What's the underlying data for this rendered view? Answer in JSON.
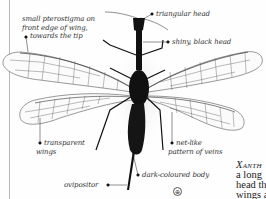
{
  "illustration": {
    "subject": "xanthostigma-snakefly",
    "labels": {
      "pterostigma": [
        "small pterostigma on",
        "front edge of wing,",
        "towards the tip"
      ],
      "head_shape": "triangular head",
      "head_color": "shiny, black head",
      "wings": [
        "transparent",
        "wings"
      ],
      "veins": [
        "net-like",
        "pattern of veins"
      ],
      "ovipositor": "ovipositor",
      "body": "dark-coloured body"
    },
    "locator_icon": "⊕"
  },
  "caption": {
    "title": "Xanth",
    "lines": [
      "a long",
      "head th",
      "wings a"
    ]
  },
  "colors": {
    "ink": "#111111",
    "vein": "#555555",
    "rule": "#b8b8b8",
    "text": "#333333"
  }
}
